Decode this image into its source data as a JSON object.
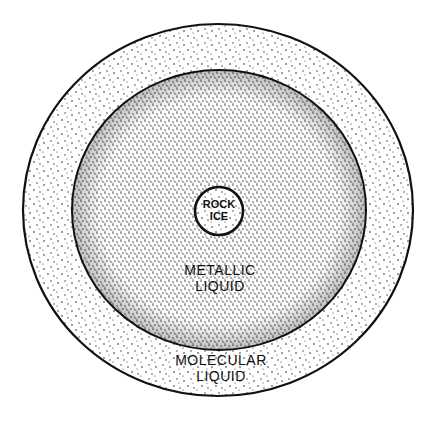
{
  "diagram": {
    "type": "planetary-interior-cross-section",
    "layers": [
      {
        "id": "molecular",
        "label_lines": [
          "MOLECULAR",
          "LIQUID"
        ],
        "shape": {
          "cx": 218,
          "cy": 210,
          "rx": 195,
          "ry": 186
        },
        "texture": "sparse-stipple"
      },
      {
        "id": "metallic",
        "label_lines": [
          "METALLIC",
          "LIQUID"
        ],
        "shape": {
          "cx": 219,
          "cy": 210,
          "rx": 147,
          "ry": 140
        },
        "texture": "dense-stipple"
      },
      {
        "id": "core",
        "label_lines": [
          "ROCK",
          "ICE"
        ],
        "shape": {
          "cx": 219,
          "cy": 211,
          "r": 24
        },
        "texture": "stipple"
      }
    ],
    "colors": {
      "background": "#ffffff",
      "ink": "#111111"
    }
  }
}
